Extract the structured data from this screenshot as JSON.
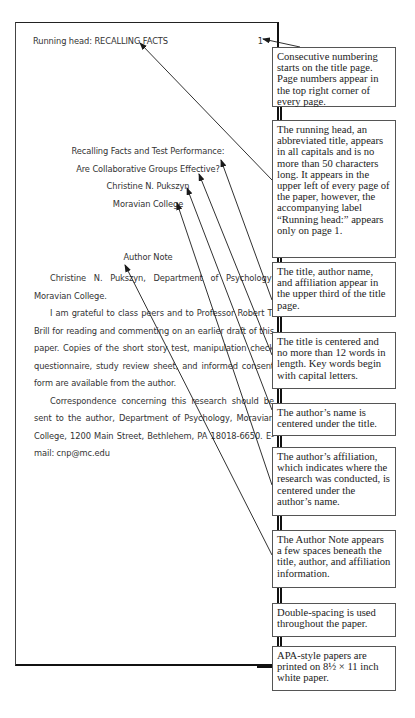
{
  "paper": {
    "running_head": "Running head: RECALLING FACTS",
    "page_number": "1",
    "title_lines": [
      "Recalling Facts and Test Performance:",
      "Are Collaborative Groups Effective?"
    ],
    "author": "Christine N. Pukszyn",
    "affiliation": "Moravian College",
    "author_note": {
      "heading": "Author Note",
      "paragraphs": [
        "Christine N. Pukszyn, Department of Psychology, Moravian College.",
        "I am grateful to class peers and to Professor Robert T. Brill for reading and commenting on an earlier draft of this paper. Copies of the short story test, manipulation check questionnaire, study review sheet, and informed consent form are available from the author.",
        "Correspondence concerning this research should be sent to the author, Department of Psychology, Moravian College, 1200 Main Street, Bethlehem, PA 18018-6650. E-mail: cnp@mc.edu"
      ]
    }
  },
  "callouts": [
    {
      "id": "page-numbering",
      "text": "Consecutive numbering starts on the title page. Page numbers appear in the top right corner of every page."
    },
    {
      "id": "running-head",
      "text": "The running head, an abbreviated title, appears in all capitals and is no more than 50 characters long. It appears in the upper left of every page of the paper, however, the accompanying label “Running head:” appears only  on page 1."
    },
    {
      "id": "upper-third",
      "text": "The title, author name, and affiliation appear in the upper third of the title page."
    },
    {
      "id": "title-centered",
      "text": "The title is centered and no more than 12 words in length. Key words begin with capital letters."
    },
    {
      "id": "author-name",
      "text": "The author’s name is centered under the title."
    },
    {
      "id": "affiliation",
      "text": "The author’s affiliation, which indicates where the research was conducted, is centered under the author’s name."
    },
    {
      "id": "author-note",
      "text": "The Author Note appears a few spaces beneath the title, author, and affiliation information."
    },
    {
      "id": "double-spacing",
      "text": "Double-spacing is used throughout the paper."
    },
    {
      "id": "paper-size",
      "text": "APA-style papers are printed on 8½ × 11 inch white paper."
    }
  ],
  "colors": {
    "page_border": "#111111",
    "paper_text": "#333333",
    "callout_text": "#222222",
    "arrow": "#1a1a1a"
  }
}
